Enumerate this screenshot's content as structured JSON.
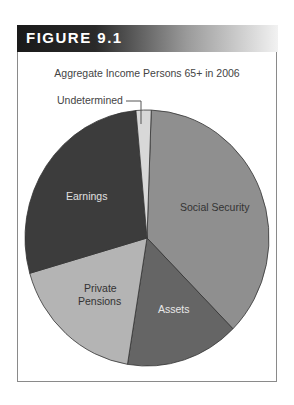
{
  "figure": {
    "label": "FIGURE 9.1"
  },
  "chart_data": {
    "type": "pie",
    "title": "Aggregate Income Persons 65+ in 2006",
    "categories": [
      "Social Security",
      "Assets",
      "Private Pensions",
      "Earnings",
      "Undetermined"
    ],
    "values": [
      37,
      15,
      18,
      28,
      2
    ],
    "colors": [
      "#8f8f8f",
      "#656565",
      "#b4b4b4",
      "#3c3c3c",
      "#d8d8d8"
    ],
    "label_colors": [
      "#333333",
      "#e8e8e8",
      "#333333",
      "#e0e0e0",
      "#444444"
    ],
    "start_angle_deg": -88,
    "direction": "clockwise",
    "legend": "none (direct labels)"
  },
  "labels": {
    "social_security": "Social Security",
    "assets": "Assets",
    "private_line1": "Private",
    "private_line2": "Pensions",
    "earnings": "Earnings",
    "undetermined": "Undetermined"
  }
}
